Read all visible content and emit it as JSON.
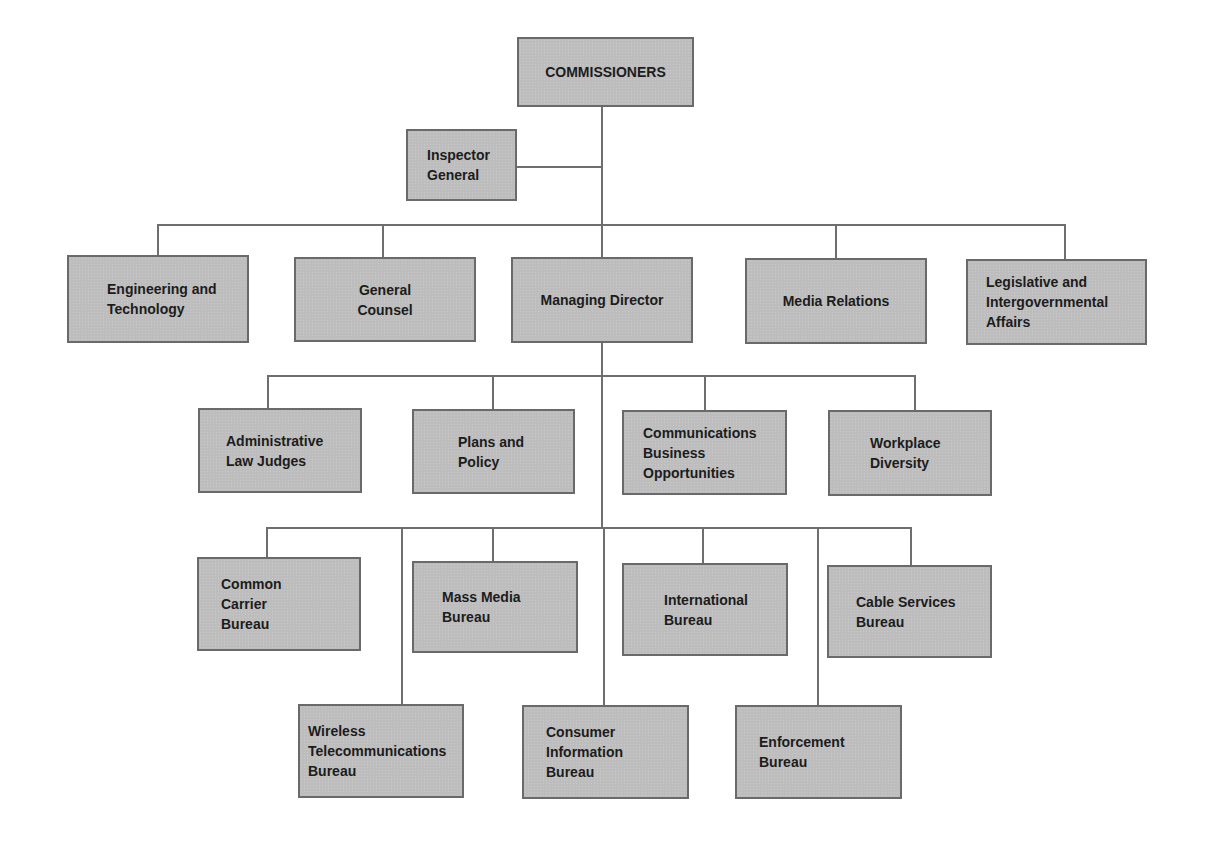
{
  "chart": {
    "title": "",
    "colors": {
      "box_fill": "#bdbdbd",
      "box_border": "#6a6a6a",
      "line": "#6e6e6e",
      "text": "#1c1c1c",
      "background": "#ffffff"
    },
    "root": {
      "label": "COMMISSIONERS"
    },
    "staff": {
      "label": "Inspector\nGeneral"
    },
    "level1": [
      {
        "label": "Engineering and\nTechnology"
      },
      {
        "label": "General\nCounsel"
      },
      {
        "label": "Managing Director"
      },
      {
        "label": "Media Relations"
      },
      {
        "label": "Legislative and\nIntergovernmental\nAffairs"
      }
    ],
    "level2": [
      {
        "label": "Administrative\nLaw Judges"
      },
      {
        "label": "Plans and\nPolicy"
      },
      {
        "label": "Communications\nBusiness\nOpportunities"
      },
      {
        "label": "Workplace\nDiversity"
      }
    ],
    "bureaus_upper": [
      {
        "label": "Common\nCarrier\nBureau"
      },
      {
        "label": "Mass Media\nBureau"
      },
      {
        "label": "International\nBureau"
      },
      {
        "label": "Cable Services\nBureau"
      }
    ],
    "bureaus_lower": [
      {
        "label": "Wireless\nTelecommunications\nBureau"
      },
      {
        "label": "Consumer\nInformation\nBureau"
      },
      {
        "label": "Enforcement\nBureau"
      }
    ]
  }
}
